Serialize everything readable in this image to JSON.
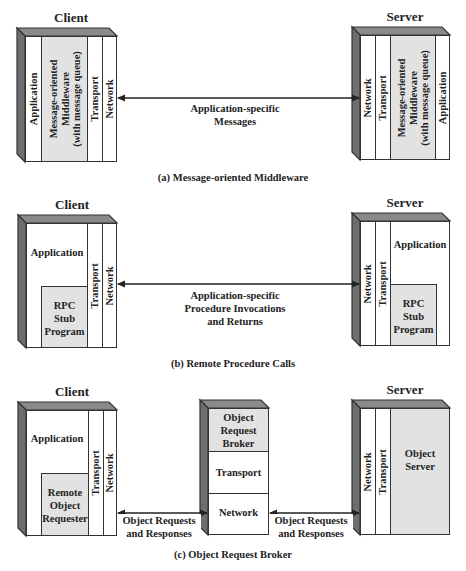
{
  "figure": {
    "colors": {
      "line": "#333333",
      "box_top": "#8a8a8a",
      "box_side": "#6e6e6e",
      "gray_fill": "#e2e2e2",
      "white_fill": "#ffffff"
    },
    "panel_a": {
      "client_title": "Client",
      "server_title": "Server",
      "client_layers": [
        "Application",
        "Message-oriented\nMiddleware\n(with message queue)",
        "Transport",
        "Network"
      ],
      "server_layers": [
        "Network",
        "Transport",
        "Message-oriented\nMiddleware\n(with message queue)",
        "Application"
      ],
      "arrow_label": [
        "Application-specific",
        "Messages"
      ],
      "caption": "(a) Message-oriented Middleware"
    },
    "panel_b": {
      "client_title": "Client",
      "server_title": "Server",
      "client_application": "Application",
      "client_stub": [
        "RPC",
        "Stub",
        "Program"
      ],
      "client_layers": [
        "Transport",
        "Network"
      ],
      "server_layers": [
        "Network",
        "Transport"
      ],
      "server_application": "Application",
      "server_stub": [
        "RPC",
        "Stub",
        "Program"
      ],
      "arrow_label": [
        "Application-specific",
        "Procedure Invocations",
        "and Returns"
      ],
      "caption": "(b) Remote Procedure Calls"
    },
    "panel_c": {
      "client_title": "Client",
      "server_title": "Server",
      "client_application": "Application",
      "client_requester": [
        "Remote",
        "Object",
        "Requester"
      ],
      "client_layers": [
        "Transport",
        "Network"
      ],
      "broker_layers": [
        [
          "Object",
          "Request",
          "Broker"
        ],
        [
          "Transport"
        ],
        [
          "Network"
        ]
      ],
      "server_layers": [
        "Network",
        "Transport"
      ],
      "server_object": [
        "Object",
        "Server"
      ],
      "left_arrow_label": [
        "Object Requests",
        "and Responses"
      ],
      "right_arrow_label": [
        "Object Requests",
        "and Responses"
      ],
      "caption": "(c) Object Request Broker"
    }
  }
}
